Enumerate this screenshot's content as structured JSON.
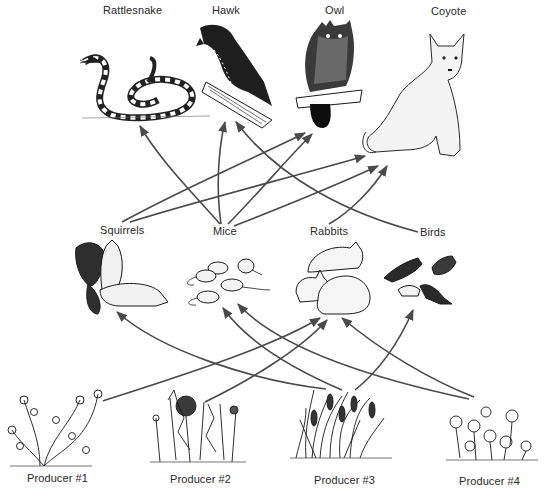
{
  "colors": {
    "arrow": "#4a4a4a",
    "ink": "#1a1a1a",
    "background": "#ffffff"
  },
  "top_consumers": [
    {
      "id": "rattlesnake",
      "label": "Rattlesnake",
      "icon": "rattlesnake-drawing"
    },
    {
      "id": "hawk",
      "label": "Hawk",
      "icon": "hawk-drawing"
    },
    {
      "id": "owl",
      "label": "Owl",
      "icon": "owl-drawing"
    },
    {
      "id": "coyote",
      "label": "Coyote",
      "icon": "coyote-drawing"
    }
  ],
  "primary_consumers": [
    {
      "id": "squirrels",
      "label": "Squirrels",
      "icon": "squirrels-drawing"
    },
    {
      "id": "mice",
      "label": "Mice",
      "icon": "mice-drawing"
    },
    {
      "id": "rabbits",
      "label": "Rabbits",
      "icon": "rabbits-drawing"
    },
    {
      "id": "birds",
      "label": "Birds",
      "icon": "birds-drawing"
    }
  ],
  "producers": [
    {
      "id": "producer1",
      "label": "Producer #1",
      "icon": "flowering-plant-drawing"
    },
    {
      "id": "producer2",
      "label": "Producer #2",
      "icon": "dandelion-drawing"
    },
    {
      "id": "producer3",
      "label": "Producer #3",
      "icon": "grass-drawing"
    },
    {
      "id": "producer4",
      "label": "Producer #4",
      "icon": "clover-drawing"
    }
  ],
  "edges": [
    {
      "from": "Squirrels",
      "to": "Owl"
    },
    {
      "from": "Squirrels",
      "to": "Coyote"
    },
    {
      "from": "Mice",
      "to": "Rattlesnake"
    },
    {
      "from": "Mice",
      "to": "Hawk"
    },
    {
      "from": "Mice",
      "to": "Owl"
    },
    {
      "from": "Mice",
      "to": "Coyote"
    },
    {
      "from": "Rabbits",
      "to": "Coyote"
    },
    {
      "from": "Birds",
      "to": "Hawk"
    },
    {
      "from": "Producer #1",
      "to": "Rabbits"
    },
    {
      "from": "Producer #2",
      "to": "Rabbits"
    },
    {
      "from": "Producer #3",
      "to": "Squirrels"
    },
    {
      "from": "Producer #3",
      "to": "Mice"
    },
    {
      "from": "Producer #3",
      "to": "Birds"
    },
    {
      "from": "Producer #4",
      "to": "Mice"
    },
    {
      "from": "Producer #4",
      "to": "Rabbits"
    }
  ]
}
